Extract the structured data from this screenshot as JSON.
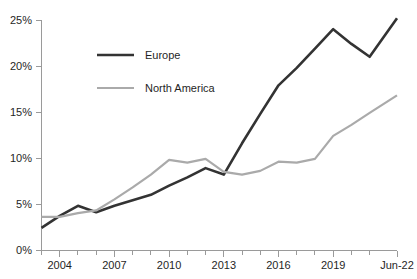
{
  "chart_data": {
    "type": "line",
    "title": "",
    "subtitle": "",
    "xlabel": "",
    "ylabel": "",
    "ylim": [
      0,
      25
    ],
    "ytick_labels": [
      "0%",
      "5%",
      "10%",
      "15%",
      "20%",
      "25%"
    ],
    "ytick_values": [
      0,
      5,
      10,
      15,
      20,
      25
    ],
    "xtick_labels": [
      "2004",
      "2007",
      "2010",
      "2013",
      "2016",
      "2019",
      "Jun-22"
    ],
    "xtick_values": [
      2004,
      2007,
      2010,
      2013,
      2016,
      2019,
      2022.5
    ],
    "x": [
      2003,
      2004,
      2005,
      2006,
      2007,
      2008,
      2009,
      2010,
      2011,
      2012,
      2013,
      2014,
      2015,
      2016,
      2017,
      2018,
      2019,
      2020,
      2021,
      2022.5
    ],
    "grid": false,
    "legend_position": "inside-upper-left",
    "series": [
      {
        "name": "Europe",
        "color": "#333333",
        "line_width": 2.6,
        "values": [
          2.4,
          3.7,
          4.8,
          4.1,
          4.8,
          5.4,
          6.0,
          7.0,
          7.9,
          8.9,
          8.2,
          11.6,
          14.8,
          17.9,
          19.8,
          21.9,
          24.0,
          22.4,
          21.0,
          25.2
        ]
      },
      {
        "name": "North America",
        "color": "#aaaaaa",
        "line_width": 2.2,
        "values": [
          3.6,
          3.6,
          4.0,
          4.3,
          5.5,
          6.8,
          8.2,
          9.8,
          9.5,
          9.9,
          8.5,
          8.2,
          8.6,
          9.6,
          9.5,
          9.9,
          12.4,
          13.6,
          14.9,
          16.8
        ]
      }
    ]
  },
  "legend": {
    "entries": [
      {
        "label": "Europe",
        "color": "#333333"
      },
      {
        "label": "North America",
        "color": "#aaaaaa"
      }
    ]
  },
  "colors": {
    "europe": "#333333",
    "north_america": "#aaaaaa",
    "axis": "#9a9a9a",
    "text": "#1f1f1f",
    "background": "#ffffff"
  }
}
